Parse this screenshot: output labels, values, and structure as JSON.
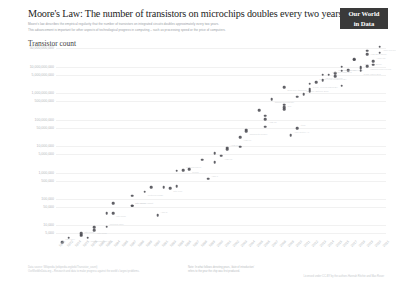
{
  "header": {
    "title": "Moore's Law: The number of transistors on microchips doubles every two years",
    "subtitle_line1": "Moore's law describes the empirical regularity that the number of transistors on integrated circuits doubles approximately every two years.",
    "subtitle_line2": "This advancement is important for other aspects of technological progress in computing – such as processing speed or the price of computers.",
    "logo_line1": "Our World",
    "logo_line2": "in Data"
  },
  "axes": {
    "y_label": "Transistor count",
    "y_ticks": [
      "50,000,000,000",
      "10,000,000,000",
      "5,000,000,000",
      "1,000,000,000",
      "500,000,000",
      "100,000,000",
      "50,000,000",
      "10,000,000",
      "5,000,000",
      "1,000,000",
      "500,000",
      "100,000",
      "50,000",
      "10,000",
      "5,000",
      "1,000"
    ],
    "x_ticks": [
      "1971",
      "1972",
      "1974",
      "1976",
      "1978",
      "1980",
      "1982",
      "1984",
      "1985",
      "1987",
      "1988",
      "1989",
      "1990",
      "1991",
      "1993",
      "1995",
      "1996",
      "1997",
      "1998",
      "1999",
      "2000",
      "2001",
      "2002",
      "2003",
      "2004",
      "2005",
      "2006",
      "2007",
      "2008",
      "2009",
      "2010",
      "2011",
      "2012",
      "2013",
      "2014",
      "2015",
      "2016",
      "2017",
      "2018",
      "2019",
      "2020",
      "2021"
    ]
  },
  "footer": {
    "source_line1": "Data source: Wikipedia (wikipedia.org/wiki/Transistor_count)",
    "source_line2": "OurWorldInData.org – Research and data to make progress against the world's largest problems.",
    "note_line1": "Note: In what follows denoting years, 'date of introduction'",
    "note_line2": "refers to the year the chip was first produced.",
    "license": "Licensed under CC-BY by the authors Hannah Ritchie and Max Roser"
  },
  "colors": {
    "dot": "#4b4b52",
    "grid": "#f1f1f1",
    "tick_text": "#b4b8bc",
    "title_text": "#1d1d1d",
    "logo_bg": "#3a3a3a",
    "annotation": "#d2d5d8"
  },
  "chart_data": {
    "type": "scatter",
    "title": "Moore's Law: The number of transistors on microchips doubles every two years",
    "xlabel": "Year of introduction",
    "ylabel": "Transistor count",
    "y_scale": "log",
    "ylim": [
      2000,
      60000000000
    ],
    "xlim": [
      1970,
      2022
    ],
    "grid": true,
    "legend": false,
    "points": [
      {
        "name": "Intel 4004",
        "year": 1971,
        "transistors": 2300
      },
      {
        "name": "Intel 8008",
        "year": 1972,
        "transistors": 3500
      },
      {
        "name": "MOS Technology 6502",
        "year": 1975,
        "transistors": 3510
      },
      {
        "name": "Motorola 6800",
        "year": 1974,
        "transistors": 4100
      },
      {
        "name": "Intel 8080",
        "year": 1974,
        "transistors": 4500
      },
      {
        "name": "RCA 1802",
        "year": 1974,
        "transistors": 5000
      },
      {
        "name": "Intel 8085",
        "year": 1976,
        "transistors": 6500
      },
      {
        "name": "Zilog Z80",
        "year": 1976,
        "transistors": 8500
      },
      {
        "name": "Motorola 6809",
        "year": 1978,
        "transistors": 9000
      },
      {
        "name": "Intel 8086",
        "year": 1978,
        "transistors": 29000
      },
      {
        "name": "Intel 8088",
        "year": 1979,
        "transistors": 29000
      },
      {
        "name": "Motorola 68000",
        "year": 1979,
        "transistors": 68000
      },
      {
        "name": "Intel 80186",
        "year": 1982,
        "transistors": 55000
      },
      {
        "name": "Intel 80286",
        "year": 1982,
        "transistors": 134000
      },
      {
        "name": "Motorola 68020",
        "year": 1984,
        "transistors": 190000
      },
      {
        "name": "Intel 80386",
        "year": 1985,
        "transistors": 275000
      },
      {
        "name": "ARM 2",
        "year": 1986,
        "transistors": 25000
      },
      {
        "name": "Motorola 68030",
        "year": 1987,
        "transistors": 273000
      },
      {
        "name": "Intel i960",
        "year": 1988,
        "transistors": 250000
      },
      {
        "name": "Intel 80486",
        "year": 1989,
        "transistors": 1180000
      },
      {
        "name": "Motorola 68040",
        "year": 1990,
        "transistors": 1200000
      },
      {
        "name": "ARM 3",
        "year": 1989,
        "transistors": 310000
      },
      {
        "name": "R4000",
        "year": 1991,
        "transistors": 1350000
      },
      {
        "name": "Pentium",
        "year": 1993,
        "transistors": 3100000
      },
      {
        "name": "ARM 7",
        "year": 1994,
        "transistors": 578977
      },
      {
        "name": "Pentium Pro",
        "year": 1995,
        "transistors": 5500000
      },
      {
        "name": "AMD K5",
        "year": 1996,
        "transistors": 4300000
      },
      {
        "name": "Pentium II",
        "year": 1997,
        "transistors": 7500000
      },
      {
        "name": "AMD K6",
        "year": 1997,
        "transistors": 8800000
      },
      {
        "name": "Pentium III",
        "year": 1999,
        "transistors": 9500000
      },
      {
        "name": "AMD K7",
        "year": 1999,
        "transistors": 22000000
      },
      {
        "name": "Pentium 4",
        "year": 2000,
        "transistors": 42000000
      },
      {
        "name": "Atom",
        "year": 2008,
        "transistors": 47000000
      },
      {
        "name": "Barton",
        "year": 2003,
        "transistors": 54300000
      },
      {
        "name": "AMD K8",
        "year": 2003,
        "transistors": 105900000
      },
      {
        "name": "Itanium 2",
        "year": 2002,
        "transistors": 220000000
      },
      {
        "name": "Cell",
        "year": 2006,
        "transistors": 241000000
      },
      {
        "name": "Core 2 Duo",
        "year": 2006,
        "transistors": 291000000
      },
      {
        "name": "Itanium 2 Montecito",
        "year": 2004,
        "transistors": 592000000
      },
      {
        "name": "Core i7 (Quad)",
        "year": 2008,
        "transistors": 731000000
      },
      {
        "name": "Six-core Opteron 2400",
        "year": 2009,
        "transistors": 904000000
      },
      {
        "name": "Six-core Core i7",
        "year": 2010,
        "transistors": 1170000000
      },
      {
        "name": "8-core Xeon Nehalem-EX",
        "year": 2010,
        "transistors": 2300000000
      },
      {
        "name": "Quad-core z196",
        "year": 2010,
        "transistors": 1400000000
      },
      {
        "name": "10-core Xeon Westmere-EX",
        "year": 2011,
        "transistors": 2600000000
      },
      {
        "name": "8-core Itanium Poulson",
        "year": 2012,
        "transistors": 3100000000
      },
      {
        "name": "62-core Xeon Phi",
        "year": 2012,
        "transistors": 5000000000
      },
      {
        "name": "15-core Xeon Ivy Bridge-EX",
        "year": 2014,
        "transistors": 4310000000
      },
      {
        "name": "18-core Xeon Haswell-E5",
        "year": 2014,
        "transistors": 5560000000
      },
      {
        "name": "22-core Xeon Broadwell-E5",
        "year": 2016,
        "transistors": 7200000000
      },
      {
        "name": "SPARC M7",
        "year": 2015,
        "transistors": 10000000000
      },
      {
        "name": "32-core AMD Epyc",
        "year": 2017,
        "transistors": 19200000000
      },
      {
        "name": "Apple A12X Bionic",
        "year": 2018,
        "transistors": 10000000000
      },
      {
        "name": "Qualcomm Snapdragon 8cx",
        "year": 2018,
        "transistors": 8500000000
      },
      {
        "name": "HiSilicon Kirin 990 5G",
        "year": 2019,
        "transistors": 10300000000
      },
      {
        "name": "AWS Graviton2",
        "year": 2019,
        "transistors": 30000000000
      },
      {
        "name": "Apple M1",
        "year": 2020,
        "transistors": 16000000000
      },
      {
        "name": "Apple A14 Bionic",
        "year": 2020,
        "transistors": 11800000000
      },
      {
        "name": "AMD Epyc Rome",
        "year": 2019,
        "transistors": 39540000000
      },
      {
        "name": "Apple M1 Max",
        "year": 2021,
        "transistors": 57000000000
      },
      {
        "name": "Apple M1 Pro",
        "year": 2021,
        "transistors": 33700000000
      },
      {
        "name": "Centriq 2400",
        "year": 2017,
        "transistors": 18000000000
      },
      {
        "name": "Tegra Xavier SoC",
        "year": 2018,
        "transistors": 7000000000
      },
      {
        "name": "IBM z13 Storage Controller",
        "year": 2015,
        "transistors": 7100000000
      },
      {
        "name": "Xbox One main SoC",
        "year": 2013,
        "transistors": 5000000000
      },
      {
        "name": "Core i7 Broadwell-U",
        "year": 2015,
        "transistors": 1900000000
      },
      {
        "name": "Dual-core Itanium 2",
        "year": 2006,
        "transistors": 1700000000
      },
      {
        "name": "Pentium D Presler",
        "year": 2006,
        "transistors": 362000000
      },
      {
        "name": "ARM Cortex-A9",
        "year": 2007,
        "transistors": 26000000
      },
      {
        "name": "Pentium M",
        "year": 2003,
        "transistors": 140000000
      },
      {
        "name": "Transmeta Crusoe",
        "year": 2000,
        "transistors": 36700000
      },
      {
        "name": "SA-110",
        "year": 1995,
        "transistors": 2500000
      },
      {
        "name": "Intel 80186 variant",
        "year": 1982,
        "transistors": 55000
      }
    ]
  }
}
